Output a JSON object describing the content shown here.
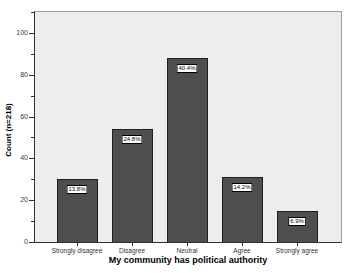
{
  "chart_data": {
    "type": "bar",
    "title": "",
    "categories": [
      "Strongly disagree",
      "Disagree",
      "Neutral",
      "Agree",
      "Strongly agree"
    ],
    "values": [
      30,
      54,
      88,
      31,
      15
    ],
    "bar_labels": [
      "13.8%",
      "24.8%",
      "40.4%",
      "14.2%",
      "6.9%"
    ],
    "n_total": 218,
    "xlabel": "My community has political authority",
    "ylabel": "Count (n=218)",
    "ylim": [
      0,
      110
    ],
    "y_major_ticks": [
      0,
      20,
      40,
      60,
      80,
      100
    ],
    "y_minor_ticks": [
      10,
      30,
      50,
      70,
      90,
      110
    ],
    "grid": false,
    "legend": "none",
    "plot_bg": "#ededed",
    "bar_fill": "#4e4e4e",
    "bar_edge": "#1f1f1f",
    "label_box_bg": "#ffffff",
    "label_box_border": "#000000",
    "axis_color": "#2f2f2f",
    "frame_color": "#9e9e9e",
    "tick_label_color": "#3a3a3a"
  }
}
